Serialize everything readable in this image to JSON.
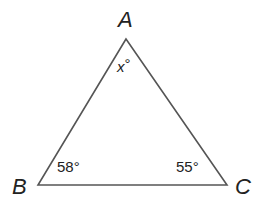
{
  "diagram": {
    "type": "triangle",
    "vertices": [
      {
        "name": "A",
        "x": 126,
        "y": 39
      },
      {
        "name": "B",
        "x": 38,
        "y": 185
      },
      {
        "name": "C",
        "x": 227,
        "y": 185
      }
    ],
    "labels": {
      "A": "A",
      "B": "B",
      "C": "C"
    },
    "angles": {
      "A": {
        "variable": "x",
        "degree": "°"
      },
      "B": "58°",
      "C": "55°"
    },
    "colors": {
      "stroke": "#555555",
      "text": "#222222"
    }
  }
}
